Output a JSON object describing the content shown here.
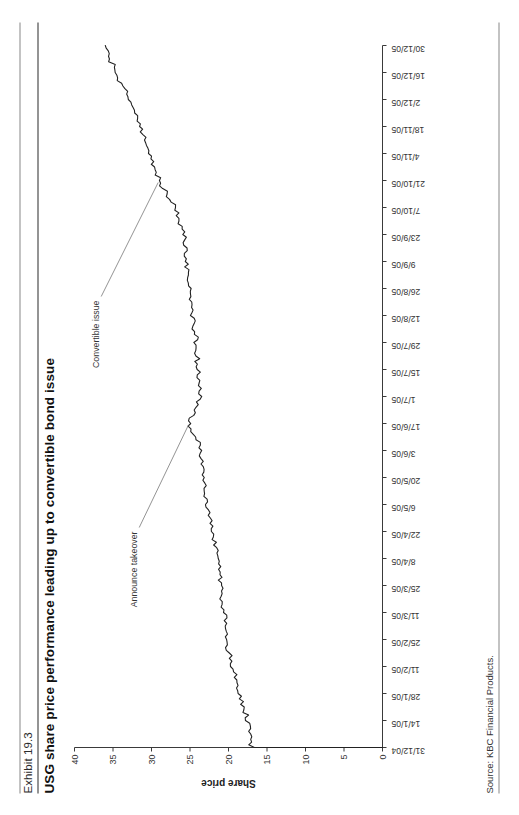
{
  "exhibit": {
    "number": "Exhibit 19.3",
    "title": "USG share price performance leading up to convertible bond issue",
    "source": "Source: KBC Financial Products."
  },
  "chart_data": {
    "type": "line",
    "title": "USG share price performance leading up to convertible bond issue",
    "xlabel": "",
    "ylabel": "Share price",
    "ylim": [
      0,
      40
    ],
    "ytick_step": 5,
    "yticks": [
      0,
      5,
      10,
      15,
      20,
      25,
      30,
      35,
      40
    ],
    "grid": false,
    "legend": "none",
    "line_color": "#222222",
    "categories": [
      "31/12/04",
      "14/1/05",
      "28/1/05",
      "11/2/05",
      "25/2/05",
      "11/3/05",
      "25/3/05",
      "8/4/05",
      "22/4/05",
      "6/5/05",
      "20/5/05",
      "3/6/05",
      "17/6/05",
      "1/7/05",
      "15/7/05",
      "29/7/05",
      "12/8/05",
      "26/8/05",
      "9/9/05",
      "23/9/05",
      "7/10/05",
      "21/10/05",
      "4/11/05",
      "18/11/05",
      "2/12/05",
      "16/12/05",
      "30/12/05"
    ],
    "series": [
      {
        "name": "USG share price",
        "values": [
          17.0,
          17.4,
          18.6,
          19.6,
          20.2,
          20.6,
          21.0,
          21.4,
          22.2,
          22.8,
          23.3,
          23.6,
          25.1,
          23.6,
          24.0,
          24.2,
          24.6,
          25.0,
          25.4,
          25.8,
          27.0,
          29.0,
          30.2,
          31.4,
          32.8,
          34.6,
          36.0
        ]
      }
    ],
    "annotations": [
      {
        "label": "Announce takeover",
        "x_category": "17/6/05",
        "y_value": 25.1
      },
      {
        "label": "Convertible issue",
        "x_category": "21/10/05",
        "y_value": 29.0
      }
    ]
  }
}
